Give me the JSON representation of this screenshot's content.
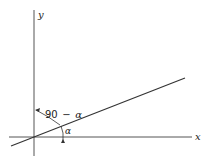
{
  "diagram": {
    "axes": {
      "x_label": "x",
      "y_label": "y"
    },
    "line": {
      "description": "straight line through origin at angle alpha to x-axis"
    },
    "angles": {
      "complement_label_num": "90",
      "complement_label_op": "−",
      "complement_label_sym": "α",
      "alpha_label": "α"
    },
    "colors": {
      "stroke": "#333333",
      "background": "#ffffff"
    }
  }
}
